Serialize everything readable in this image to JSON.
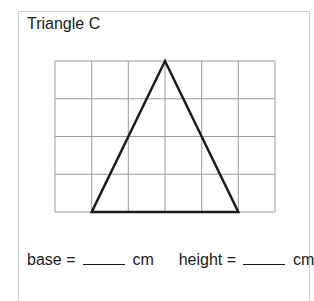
{
  "title": "Triangle C",
  "grid": {
    "columns": 6,
    "rows": 4,
    "line_color": "#9a9a9a"
  },
  "triangle": {
    "base_units": 4,
    "height_units": 4,
    "stroke_color": "#1a1a1a",
    "vertices_grid": [
      [
        1,
        4
      ],
      [
        5,
        4
      ],
      [
        3,
        0
      ]
    ]
  },
  "answer": {
    "base_label": "base =",
    "base_value": "",
    "base_unit": "cm",
    "height_label": "height =",
    "height_value": "",
    "height_unit": "cm"
  }
}
